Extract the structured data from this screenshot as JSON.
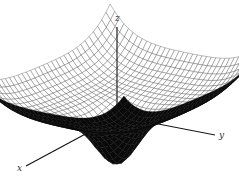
{
  "figure": {
    "axes": {
      "x_label": "x",
      "y_label": "y",
      "z_label": "z"
    },
    "colors": {
      "background": "#ffffff",
      "mesh": "#444444",
      "axes": "#111111",
      "underside": "#0a0a0a"
    }
  }
}
